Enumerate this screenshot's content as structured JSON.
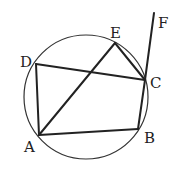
{
  "diagram": {
    "type": "geometry",
    "circle": {
      "cx": 86,
      "cy": 97,
      "r": 62
    },
    "points": {
      "A": {
        "label": "A",
        "x": 39,
        "y": 135,
        "lx": 24,
        "ly": 152
      },
      "B": {
        "label": "B",
        "x": 138,
        "y": 129,
        "lx": 144,
        "ly": 143
      },
      "C": {
        "label": "C",
        "x": 145,
        "y": 80,
        "lx": 150,
        "ly": 88
      },
      "D": {
        "label": "D",
        "x": 36,
        "y": 64,
        "lx": 20,
        "ly": 67
      },
      "E": {
        "label": "E",
        "x": 115,
        "y": 43,
        "lx": 110,
        "ly": 38
      },
      "F": {
        "label": "F",
        "x": 154,
        "y": 13,
        "lx": 158,
        "ly": 28
      }
    },
    "segments": [
      "AB",
      "BC",
      "CD",
      "DA",
      "AE",
      "EC",
      "CF"
    ]
  }
}
